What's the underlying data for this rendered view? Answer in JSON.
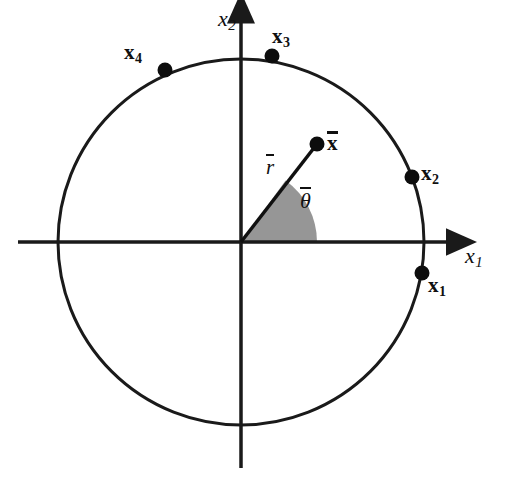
{
  "figure": {
    "domain": "diagram",
    "background_color": "#ffffff",
    "width": 507,
    "height": 478,
    "stroke_color": "#1a1a1a",
    "wedge_fill_color": "#969696",
    "point_color": "#0d0d0d"
  },
  "axes": {
    "origin": {
      "x": 241,
      "y": 242
    },
    "x_axis": {
      "label": "x",
      "subscript": "1",
      "label_pos": {
        "x": 465,
        "y": 245
      },
      "start": {
        "x": 18,
        "y": 242
      },
      "end": {
        "x": 455,
        "y": 242
      },
      "arrow": "right"
    },
    "y_axis": {
      "label": "x",
      "subscript": "2",
      "label_pos": {
        "x": 218,
        "y": 8
      },
      "start": {
        "x": 241,
        "y": 468
      },
      "end": {
        "x": 241,
        "y": 13
      },
      "arrow": "up"
    }
  },
  "circle": {
    "center": {
      "x": 241,
      "y": 242
    },
    "radius": 183,
    "stroke_width": 3
  },
  "chart_data": {
    "type": "scatter",
    "title": "",
    "xlabel": "x1",
    "ylabel": "x2",
    "points": [
      {
        "name": "x1",
        "label": "x",
        "subscript": "1",
        "angle_deg": -9.7,
        "radius": 183,
        "px": {
          "x": 422,
          "y": 273
        },
        "label_pos": {
          "x": 428,
          "y": 275
        }
      },
      {
        "name": "x2",
        "label": "x",
        "subscript": "2",
        "angle_deg": 20.7,
        "radius": 183,
        "px": {
          "x": 412,
          "y": 177
        },
        "label_pos": {
          "x": 421,
          "y": 163
        }
      },
      {
        "name": "x3",
        "label": "x",
        "subscript": "3",
        "angle_deg": 80.3,
        "radius": 183,
        "px": {
          "x": 272,
          "y": 56
        },
        "label_pos": {
          "x": 272,
          "y": 26
        }
      },
      {
        "name": "x4",
        "label": "x",
        "subscript": "4",
        "angle_deg": 113.6,
        "radius": 183,
        "px": {
          "x": 165,
          "y": 70
        },
        "label_pos": {
          "x": 124,
          "y": 42
        }
      }
    ],
    "mean_vector": {
      "name": "x-bar",
      "label": "x",
      "overline": true,
      "angle_deg": 54.1,
      "radius": 120,
      "px": {
        "x": 317,
        "y": 144
      },
      "label_pos": {
        "x": 327,
        "y": 130
      }
    },
    "radius_label": {
      "name": "r-bar",
      "label": "r",
      "overline": true,
      "label_pos": {
        "x": 266,
        "y": 153
      }
    },
    "angle_label": {
      "name": "theta-bar",
      "label": "θ",
      "overline": true,
      "label_pos": {
        "x": 300,
        "y": 186
      }
    },
    "angle_wedge": {
      "start_deg": 0,
      "end_deg": 54.1,
      "radius": 76,
      "fill": "#969696"
    }
  }
}
